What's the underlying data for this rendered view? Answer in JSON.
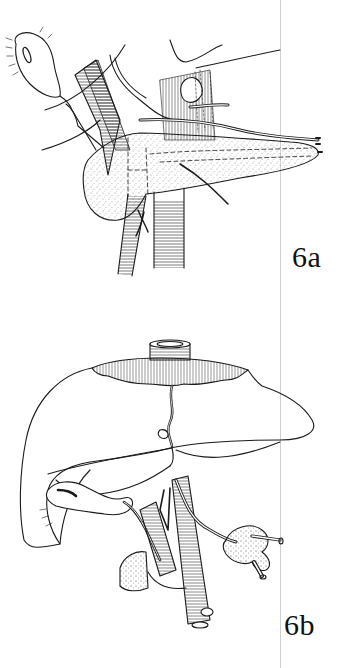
{
  "figures": [
    {
      "id": "6a",
      "label": "6a",
      "description": "Line drawing: pancreas with dotted texture overlying aorta and vena cava, splenic vessels running along its upper border, gallbladder at upper left",
      "structures": [
        "gallbladder-icon",
        "pancreas-icon",
        "aorta-icon",
        "vena-cava-icon",
        "splenic-artery-icon",
        "portal-vein-icon",
        "bile-duct-icon"
      ]
    },
    {
      "id": "6b",
      "label": "6b",
      "description": "Line drawing: liver with diaphragm cuff and hepatic vein at top, gallbladder under right lobe, vessels and ducts descending to duodenum/pancreas segment",
      "structures": [
        "liver-icon",
        "diaphragm-cuff-icon",
        "vena-cava-icon",
        "gallbladder-icon",
        "portal-vein-icon",
        "aorta-icon",
        "duodenum-icon",
        "kidney-fragment-icon"
      ]
    }
  ],
  "colors": {
    "ink": "#1a1a1a",
    "paper": "#ffffff",
    "rule": "#cfcfcf"
  }
}
